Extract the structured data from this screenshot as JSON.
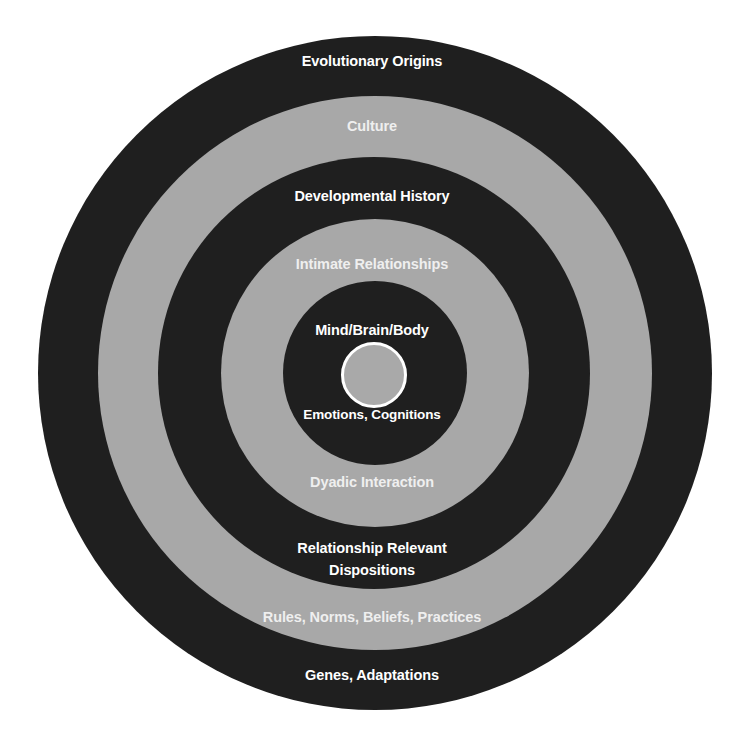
{
  "diagram": {
    "type": "concentric-circles",
    "colors": {
      "dark_ring": "#1f1f1f",
      "light_ring": "#a8a8a8",
      "core_fill": "#a9a9a9",
      "core_stroke": "#ffffff",
      "text_on_dark": "#ffffff",
      "text_on_light": "#efefef"
    },
    "rings": [
      {
        "name": "Evolutionary Origins",
        "shade": "dark",
        "top_label": "Evolutionary Origins",
        "bottom_label": "Genes, Adaptations"
      },
      {
        "name": "Culture",
        "shade": "light",
        "top_label": "Culture",
        "bottom_label": "Rules, Norms, Beliefs, Practices"
      },
      {
        "name": "Developmental History",
        "shade": "dark",
        "top_label": "Developmental History",
        "bottom_label_line1": "Relationship Relevant",
        "bottom_label_line2": "Dispositions"
      },
      {
        "name": "Intimate Relationships",
        "shade": "light",
        "top_label": "Intimate Relationships",
        "bottom_label": "Dyadic Interaction"
      },
      {
        "name": "Mind/Brain/Body",
        "shade": "dark",
        "top_label": "Mind/Brain/Body",
        "bottom_label": "Emotions, Cognitions"
      }
    ],
    "core": {
      "shade": "light",
      "outlined": true
    }
  }
}
